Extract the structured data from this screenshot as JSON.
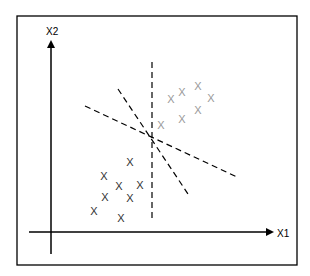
{
  "diagram": {
    "title": "",
    "x_axis_label": "X1",
    "y_axis_label": "X2",
    "marker": "X",
    "colors": {
      "frame": "#000000",
      "axis": "#000000",
      "class_a": "#333333",
      "class_b": "#999999",
      "separator": "#000000"
    }
  },
  "chart_data": {
    "type": "scatter",
    "title": "",
    "xlabel": "X1",
    "ylabel": "X2",
    "grid": false,
    "series": [
      {
        "name": "class_a",
        "color": "#333333",
        "marker": "X",
        "points": [
          [
            130,
            162
          ],
          [
            104,
            176
          ],
          [
            119,
            186
          ],
          [
            140,
            185
          ],
          [
            105,
            197
          ],
          [
            130,
            198
          ],
          [
            94,
            211
          ],
          [
            121,
            218
          ]
        ]
      },
      {
        "name": "class_b",
        "color": "#999999",
        "marker": "X",
        "points": [
          [
            161,
            125
          ],
          [
            171,
            99
          ],
          [
            182,
            92
          ],
          [
            198,
            86
          ],
          [
            211,
            98
          ],
          [
            198,
            110
          ],
          [
            182,
            119
          ]
        ]
      }
    ],
    "separating_lines": [
      {
        "style": "dashed",
        "from": [
          152,
          62
        ],
        "to": [
          152,
          222
        ]
      },
      {
        "style": "dashed",
        "from": [
          85,
          106
        ],
        "to": [
          237,
          177
        ]
      },
      {
        "style": "dashed",
        "from": [
          118,
          89
        ],
        "to": [
          190,
          197
        ]
      }
    ]
  }
}
